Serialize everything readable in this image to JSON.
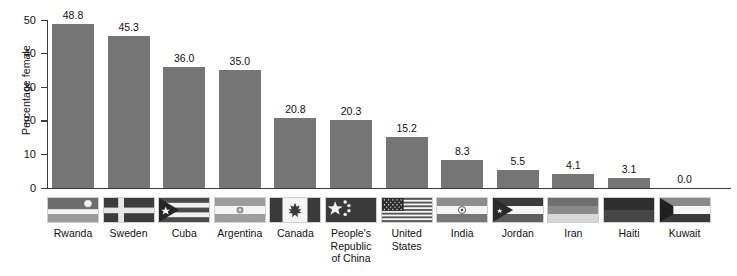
{
  "chart_data": {
    "type": "bar",
    "title": "",
    "xlabel": "",
    "ylabel": "Percentage female",
    "ylim": [
      0,
      50
    ],
    "yticks": [
      0,
      10,
      20,
      30,
      40,
      50
    ],
    "ytick_labels": [
      "0",
      "10",
      "20",
      "30",
      "40",
      "50"
    ],
    "grid": false,
    "legend": "none",
    "bar_color": "#767676",
    "axis_color": "#3a3a3a",
    "categories": [
      "Rwanda",
      "Sweden",
      "Cuba",
      "Argentina",
      "Canada",
      "People's Republic of China",
      "United States",
      "India",
      "Jordan",
      "Iran",
      "Haiti",
      "Kuwait"
    ],
    "values": [
      48.8,
      45.3,
      36.0,
      35.0,
      20.8,
      20.3,
      15.2,
      8.3,
      5.5,
      4.1,
      3.1,
      0.0
    ],
    "value_labels": [
      "48.8",
      "45.3",
      "36.0",
      "35.0",
      "20.8",
      "20.3",
      "15.2",
      "8.3",
      "5.5",
      "4.1",
      "3.1",
      "0.0"
    ]
  },
  "axis": {
    "y_title": "Percentage female"
  },
  "categories_display": [
    {
      "name": "Rwanda",
      "lines": [
        "Rwanda"
      ],
      "flag": "flag-rwanda"
    },
    {
      "name": "Sweden",
      "lines": [
        "Sweden"
      ],
      "flag": "flag-sweden"
    },
    {
      "name": "Cuba",
      "lines": [
        "Cuba"
      ],
      "flag": "flag-cuba"
    },
    {
      "name": "Argentina",
      "lines": [
        "Argentina"
      ],
      "flag": "flag-argentina"
    },
    {
      "name": "Canada",
      "lines": [
        "Canada"
      ],
      "flag": "flag-canada"
    },
    {
      "name": "People's Republic of China",
      "lines": [
        "People's",
        "Republic",
        "of China"
      ],
      "flag": "flag-china"
    },
    {
      "name": "United States",
      "lines": [
        "United",
        "States"
      ],
      "flag": "flag-united-states"
    },
    {
      "name": "India",
      "lines": [
        "India"
      ],
      "flag": "flag-india"
    },
    {
      "name": "Jordan",
      "lines": [
        "Jordan"
      ],
      "flag": "flag-jordan"
    },
    {
      "name": "Iran",
      "lines": [
        "Iran"
      ],
      "flag": "flag-iran"
    },
    {
      "name": "Haiti",
      "lines": [
        "Haiti"
      ],
      "flag": "flag-haiti"
    },
    {
      "name": "Kuwait",
      "lines": [
        "Kuwait"
      ],
      "flag": "flag-kuwait"
    }
  ],
  "labels": {
    "rwanda": "Rwanda",
    "sweden": "Sweden",
    "cuba": "Cuba",
    "argentina": "Argentina",
    "canada": "Canada",
    "china_l1": "People's",
    "china_l2": "Republic",
    "china_l3": "of China",
    "us_l1": "United",
    "us_l2": "States",
    "india": "India",
    "jordan": "Jordan",
    "iran": "Iran",
    "haiti": "Haiti",
    "kuwait": "Kuwait"
  }
}
